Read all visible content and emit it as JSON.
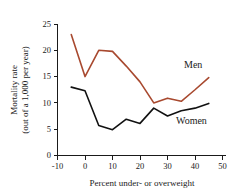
{
  "chart_data": {
    "type": "line",
    "title": "",
    "xlabel": "Percent under- or overweight",
    "ylabel": "Mortality rate (out of a 1,000 per year)",
    "ylabel_line1": "Mortality rate",
    "ylabel_line2": "(out of a 1,000 per year)",
    "xlim": [
      -10,
      50
    ],
    "ylim": [
      0,
      25
    ],
    "grid": false,
    "legend_position": "inline-right",
    "xticks": [
      -10,
      0,
      10,
      20,
      30,
      40,
      50
    ],
    "xtick_labels": [
      "-10",
      "0",
      "10",
      "20",
      "30",
      "40",
      "50"
    ],
    "yticks": [
      0,
      5,
      10,
      15,
      20,
      25
    ],
    "ytick_labels": [
      "0",
      "5",
      "10",
      "15",
      "20",
      "25"
    ],
    "x": [
      -5,
      0,
      5,
      10,
      15,
      20,
      25,
      30,
      35,
      40,
      45
    ],
    "series": [
      {
        "name": "Men",
        "color": "#A8492F",
        "values": [
          23.0,
          15.0,
          20.0,
          19.8,
          17.0,
          14.0,
          10.0,
          10.9,
          10.3,
          12.5,
          14.8
        ]
      },
      {
        "name": "Women",
        "color": "#111111",
        "values": [
          13.0,
          12.3,
          5.7,
          4.9,
          6.9,
          6.1,
          9.0,
          7.5,
          8.5,
          9.0,
          9.9
        ]
      }
    ],
    "annotations": [
      {
        "text": "Men",
        "series": "Men",
        "x_px": 184,
        "y_px": 68
      },
      {
        "text": "Women",
        "series": "Women",
        "x_px": 176,
        "y_px": 120
      }
    ]
  }
}
